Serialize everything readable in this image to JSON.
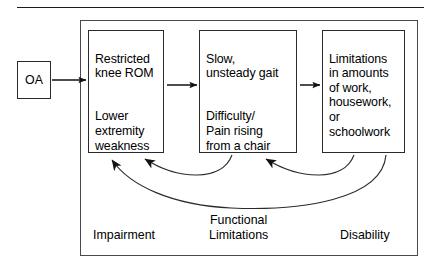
{
  "diagram": {
    "title_rule": "horizontal-rule",
    "source_node": {
      "label": "OA"
    },
    "boxes": [
      {
        "id": "impairment",
        "lines": [
          "Restricted\nknee ROM",
          "Lower\nextremity\nweakness"
        ]
      },
      {
        "id": "functional",
        "lines": [
          "Slow,\nunsteady gait",
          "Difficulty/\nPain rising\nfrom a chair"
        ]
      },
      {
        "id": "disability",
        "lines": [
          "Limitations\nin amounts\nof work,\nhousework,\nor\nschoolwork"
        ]
      }
    ],
    "stage_labels": {
      "impairment": "Impairment",
      "functional": "Functional\nLimitations",
      "disability": "Disability"
    },
    "colors": {
      "stroke": "#2b2b2b",
      "frame": "#4a4a4a",
      "text": "#000000",
      "background": "#ffffff"
    },
    "flow_arrows": [
      {
        "from": "OA",
        "to": "impairment"
      },
      {
        "from": "impairment",
        "to": "functional"
      },
      {
        "from": "functional",
        "to": "disability"
      }
    ],
    "feedback_arrows": [
      {
        "from": "functional",
        "to": "impairment"
      },
      {
        "from": "disability",
        "to": "functional"
      },
      {
        "from": "disability",
        "to": "impairment"
      }
    ]
  }
}
